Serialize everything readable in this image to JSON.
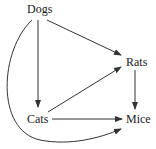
{
  "diagram": {
    "type": "directed-graph",
    "nodes": [
      {
        "id": "dogs",
        "label": "Dogs"
      },
      {
        "id": "rats",
        "label": "Rats"
      },
      {
        "id": "cats",
        "label": "Cats"
      },
      {
        "id": "mice",
        "label": "Mice"
      }
    ],
    "edges": [
      {
        "from": "Dogs",
        "to": "Rats"
      },
      {
        "from": "Dogs",
        "to": "Cats"
      },
      {
        "from": "Dogs",
        "to": "Mice",
        "style": "curved"
      },
      {
        "from": "Cats",
        "to": "Rats"
      },
      {
        "from": "Cats",
        "to": "Mice"
      },
      {
        "from": "Rats",
        "to": "Mice"
      }
    ],
    "colors": {
      "line": "#333333",
      "text": "#222222",
      "background": "#ffffff"
    }
  }
}
